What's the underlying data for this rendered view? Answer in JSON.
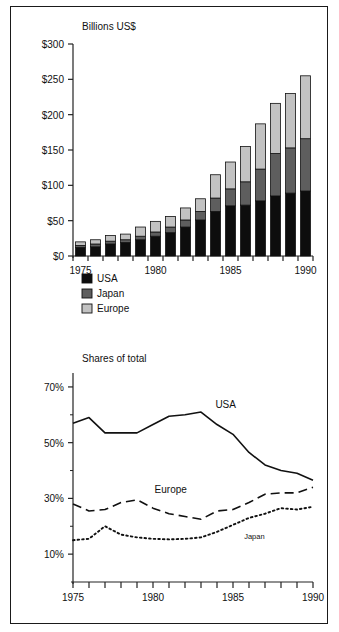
{
  "figure": {
    "background": "#ffffff",
    "border_color": "#1a1a1a"
  },
  "colors": {
    "usa": "#0d0d0d",
    "japan": "#5e5e5e",
    "europe": "#c2c2c2",
    "outline": "#111111",
    "axis": "#222222"
  },
  "chart_data": [
    {
      "type": "bar",
      "id": "semiconductor-market-bar",
      "title": "Billions US$",
      "xlabel": "",
      "ylabel": "",
      "stacked": true,
      "grid": false,
      "legend_position": "below-left",
      "ylim": [
        0,
        300
      ],
      "yticks": [
        0,
        50,
        100,
        150,
        200,
        250,
        300
      ],
      "ytick_labels": [
        "$0",
        "$50",
        "$100",
        "$150",
        "$200",
        "$250",
        "$300"
      ],
      "xlim": [
        1974.5,
        1990.5
      ],
      "categories": [
        1975,
        1976,
        1977,
        1978,
        1979,
        1980,
        1981,
        1982,
        1983,
        1984,
        1985,
        1986,
        1987,
        1988,
        1989,
        1990
      ],
      "xtick_labels": [
        "1975",
        "",
        "",
        "",
        "",
        "1980",
        "",
        "",
        "",
        "",
        "1985",
        "",
        "",
        "",
        "",
        "1990"
      ],
      "series": [
        {
          "name": "USA",
          "color_key": "usa",
          "values": [
            12,
            13,
            17,
            19,
            23,
            28,
            33,
            41,
            51,
            63,
            71,
            72,
            78,
            85,
            89,
            92
          ]
        },
        {
          "name": "Japan",
          "color_key": "japan",
          "values": [
            3,
            4,
            4,
            4,
            5,
            6,
            8,
            10,
            12,
            19,
            24,
            33,
            45,
            60,
            64,
            74
          ]
        },
        {
          "name": "Europe",
          "color_key": "europe",
          "values": [
            5,
            6,
            8,
            8,
            13,
            15,
            15,
            17,
            18,
            33,
            38,
            50,
            64,
            71,
            77,
            89
          ]
        }
      ],
      "totals": [
        20,
        23,
        29,
        31,
        41,
        49,
        56,
        68,
        81,
        115,
        133,
        155,
        187,
        216,
        230,
        255
      ],
      "legend": [
        {
          "label": "USA",
          "color_key": "usa"
        },
        {
          "label": "Japan",
          "color_key": "japan"
        },
        {
          "label": "Europe",
          "color_key": "europe"
        }
      ]
    },
    {
      "type": "line",
      "id": "shares-of-total-line",
      "title": "Shares of total",
      "xlabel": "",
      "ylabel": "",
      "grid": false,
      "ylim": [
        0,
        70
      ],
      "yticks": [
        10,
        30,
        50,
        70
      ],
      "ytick_labels": [
        "10%",
        "30%",
        "50%",
        "70%"
      ],
      "yminor": [
        20,
        40,
        60
      ],
      "xlim": [
        1975,
        1990
      ],
      "x": [
        1975,
        1976,
        1977,
        1978,
        1979,
        1980,
        1981,
        1982,
        1983,
        1984,
        1985,
        1986,
        1987,
        1988,
        1989,
        1990
      ],
      "xtick_labels": [
        "1975",
        "",
        "",
        "",
        "",
        "1980",
        "",
        "",
        "",
        "",
        "1985",
        "",
        "",
        "",
        "",
        "1990"
      ],
      "series": [
        {
          "name": "USA",
          "style": "solid",
          "annotation": "USA",
          "values": [
            57.0,
            59.0,
            53.5,
            53.5,
            53.5,
            56.5,
            59.5,
            60.0,
            61.0,
            56.5,
            53.0,
            46.5,
            42.0,
            40.0,
            39.0,
            36.5
          ]
        },
        {
          "name": "Europe",
          "style": "dashed",
          "annotation": "Europe",
          "values": [
            28.0,
            25.5,
            26.0,
            28.5,
            29.5,
            26.5,
            24.5,
            23.5,
            22.5,
            25.5,
            26.0,
            28.5,
            31.5,
            32.0,
            32.0,
            34.0
          ]
        },
        {
          "name": "Japan",
          "style": "dotted",
          "annotation": "Japan",
          "values": [
            15.0,
            15.5,
            20.0,
            17.0,
            16.0,
            15.5,
            15.3,
            15.5,
            16.0,
            18.0,
            20.5,
            23.0,
            24.5,
            26.5,
            26.0,
            27.0
          ]
        }
      ]
    }
  ]
}
